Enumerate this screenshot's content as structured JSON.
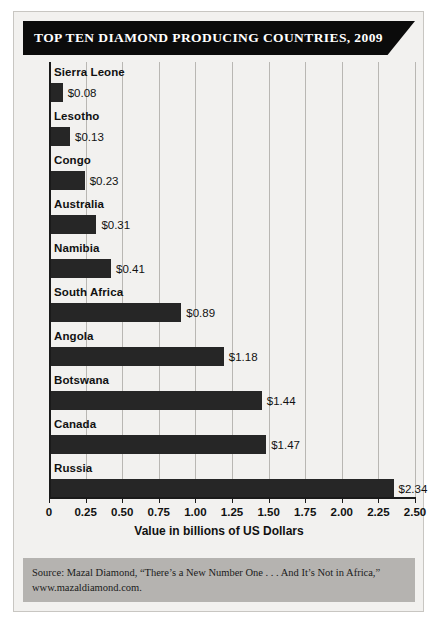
{
  "title": "TOP TEN DIAMOND PRODUCING COUNTRIES, 2009",
  "source": {
    "line1": "Source: Mazal Diamond, “There’s a New Number One . . . And It’s Not in Africa,”",
    "line2": "www.mazaldiamond.com."
  },
  "chart_data": {
    "type": "bar",
    "orientation": "horizontal",
    "title": "TOP TEN DIAMOND PRODUCING COUNTRIES, 2009",
    "xlabel": "Value in billions of US Dollars",
    "ylabel": "",
    "xlim": [
      0,
      2.5
    ],
    "xticks": [
      "0",
      "0.25",
      "0.50",
      "0.75",
      "1.00",
      "1.25",
      "1.50",
      "1.75",
      "2.00",
      "2.25",
      "2.50"
    ],
    "xtick_values": [
      0,
      0.25,
      0.5,
      0.75,
      1.0,
      1.25,
      1.5,
      1.75,
      2.0,
      2.25,
      2.5
    ],
    "grid": true,
    "legend": "none",
    "bar_color": "#262626",
    "categories": [
      "Sierra Leone",
      "Lesotho",
      "Congo",
      "Australia",
      "Namibia",
      "South Africa",
      "Angola",
      "Botswana",
      "Canada",
      "Russia"
    ],
    "values": [
      0.08,
      0.13,
      0.23,
      0.31,
      0.41,
      0.89,
      1.18,
      1.44,
      1.47,
      2.34
    ],
    "data_labels": [
      "$0.08",
      "$0.13",
      "$0.23",
      "$0.31",
      "$0.41",
      "$0.89",
      "$1.18",
      "$1.44",
      "$1.47",
      "$2.34"
    ]
  }
}
